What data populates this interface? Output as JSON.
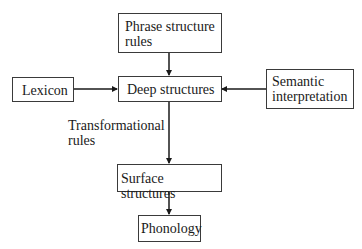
{
  "diagram": {
    "nodes": {
      "phrase_structure_rules": {
        "line1": "Phrase structure",
        "line2": "rules"
      },
      "lexicon": {
        "label": "Lexicon"
      },
      "deep_structures": {
        "label": "Deep structures"
      },
      "semantic_interpretation": {
        "line1": "Semantic",
        "line2": "interpretation"
      },
      "surface_structures": {
        "label": "Surface structures"
      },
      "phonology": {
        "label": "Phonology"
      }
    },
    "edge_labels": {
      "transformational_rules": {
        "line1": "Transformational",
        "line2": "rules"
      }
    },
    "edges": [
      {
        "from": "Phrase structure rules",
        "to": "Deep structures"
      },
      {
        "from": "Lexicon",
        "to": "Deep structures"
      },
      {
        "from": "Semantic interpretation",
        "to": "Deep structures"
      },
      {
        "from": "Deep structures",
        "to": "Surface structures",
        "label": "Transformational rules"
      },
      {
        "from": "Surface structures",
        "to": "Phonology"
      }
    ],
    "colors": {
      "line": "#1a1a1a",
      "border": "#3a3a3a",
      "background": "#ffffff"
    }
  }
}
